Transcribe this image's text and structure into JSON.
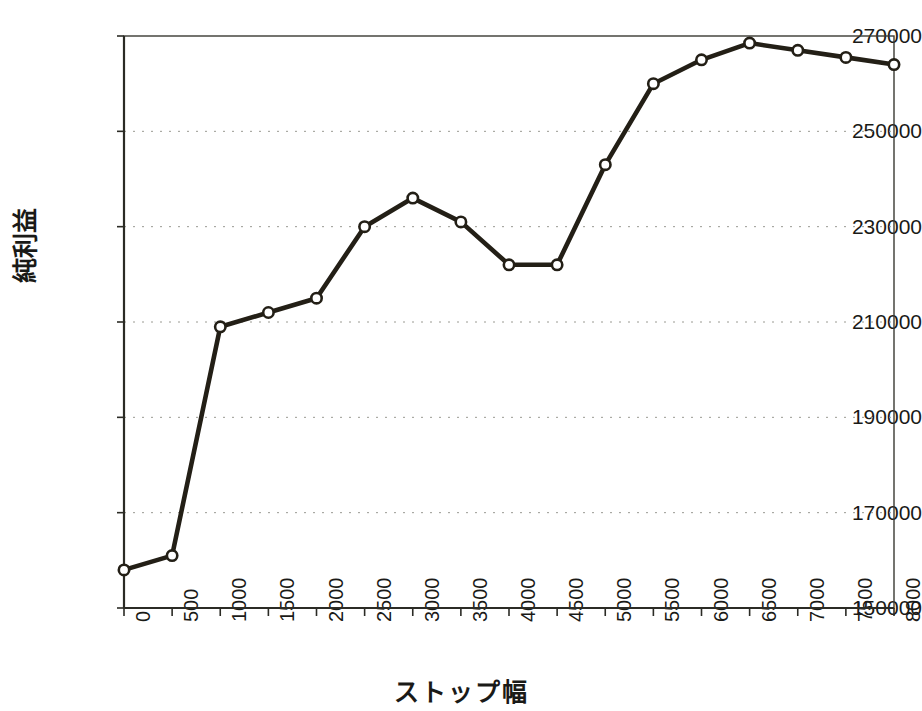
{
  "chart_data": {
    "type": "line",
    "title": "",
    "xlabel": "ストップ幅",
    "ylabel": "純利益",
    "x": [
      0,
      500,
      1000,
      1500,
      2000,
      2500,
      3000,
      3500,
      4000,
      4500,
      5000,
      5500,
      6000,
      6500,
      7000,
      7500,
      8000
    ],
    "xtick_labels": [
      "0",
      "500",
      "1000",
      "1500",
      "2000",
      "2500",
      "3000",
      "3500",
      "4000",
      "4500",
      "5000",
      "5500",
      "6000",
      "6500",
      "7000",
      "7500",
      "8000"
    ],
    "values": [
      158000,
      161000,
      209000,
      212000,
      215000,
      230000,
      236000,
      231000,
      222000,
      222000,
      243000,
      260000,
      265000,
      268500,
      267000,
      265500,
      264000
    ],
    "ytick_labels": [
      "270000",
      "250000",
      "230000",
      "210000",
      "190000",
      "170000",
      "150000"
    ],
    "yticks": [
      270000,
      250000,
      230000,
      210000,
      190000,
      170000,
      150000
    ],
    "ylim": [
      150000,
      270000
    ],
    "xlim": [
      0,
      8000
    ],
    "grid": "horizontal-dotted",
    "legend": "none",
    "marker": "open-circle",
    "line_color": "#231f16",
    "marker_fill": "#ffffff",
    "grid_color": "#9a9a92",
    "axis_color": "#3a3a33",
    "series_name": "純利益"
  }
}
